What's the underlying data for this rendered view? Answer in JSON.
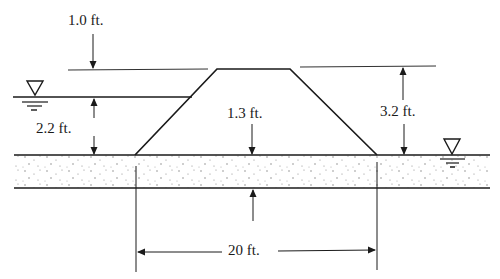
{
  "diagram": {
    "type": "levee-cross-section",
    "colors": {
      "ink": "#1a1a1a",
      "ground_dots": "#7a7a7a",
      "background": "#ffffff"
    },
    "labels": {
      "freeboard": "1.0 ft.",
      "water_depth_left": "2.2 ft.",
      "levee_center_height": "1.3 ft.",
      "levee_height_right": "3.2 ft.",
      "base_width": "20 ft."
    },
    "symbols": {
      "left_water_surface": "water-level-triangle",
      "right_water_surface": "water-level-triangle"
    }
  }
}
